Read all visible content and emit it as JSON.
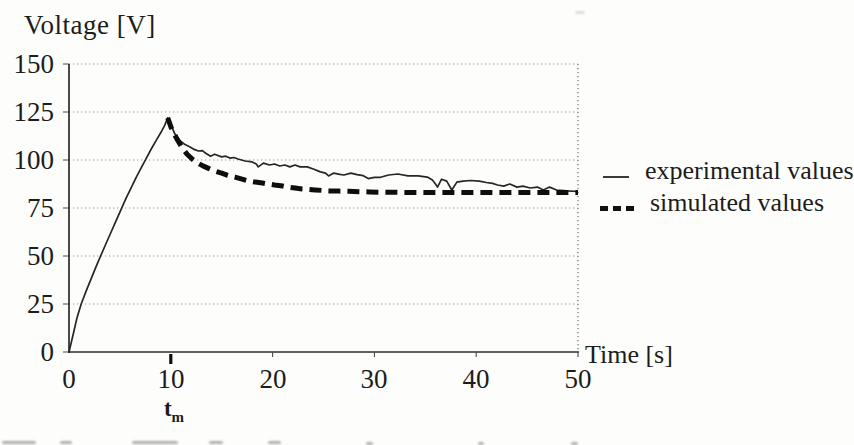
{
  "title": "Voltage [V]",
  "x_axis": {
    "label": "Time [s]",
    "ticks": [
      "0",
      "10",
      "20",
      "30",
      "40",
      "50"
    ],
    "marker_label": "t",
    "marker_sub": "m"
  },
  "y_axis": {
    "ticks": [
      "150",
      "125",
      "100",
      "75",
      "50",
      "25",
      "0"
    ]
  },
  "legend": {
    "items": [
      {
        "label": "experimental values",
        "style": "solid"
      },
      {
        "label": "simulated values",
        "style": "dashed"
      }
    ]
  },
  "colors": {
    "ink": "#1c1c1c",
    "grid": "#9b9b9b",
    "axis": "#2b2b2b",
    "background": "#fdfdfb"
  },
  "chart_data": {
    "type": "line",
    "title": "Voltage [V]",
    "xlabel": "Time [s]",
    "ylabel": "Voltage [V]",
    "xlim": [
      0,
      50
    ],
    "ylim": [
      0,
      150
    ],
    "x_ticks": [
      0,
      10,
      20,
      30,
      40,
      50
    ],
    "y_ticks": [
      0,
      25,
      50,
      75,
      100,
      125,
      150
    ],
    "grid": true,
    "grid_style": "dotted",
    "legend_position": "right",
    "annotations": [
      {
        "text": "tm",
        "x": 10,
        "meaning": "bold tick below x-axis marking time of voltage maximum"
      }
    ],
    "series": [
      {
        "name": "experimental values",
        "line": "solid",
        "width": "thin",
        "points": [
          [
            0,
            0
          ],
          [
            0.4,
            9
          ],
          [
            0.8,
            18
          ],
          [
            1.2,
            25
          ],
          [
            1.7,
            32
          ],
          [
            2.2,
            38.5
          ],
          [
            2.7,
            45
          ],
          [
            3.1,
            50
          ],
          [
            3.6,
            56
          ],
          [
            4.1,
            62
          ],
          [
            4.6,
            68
          ],
          [
            5.1,
            74
          ],
          [
            5.6,
            80
          ],
          [
            6.1,
            85.5
          ],
          [
            6.6,
            91
          ],
          [
            7.1,
            96
          ],
          [
            7.6,
            101
          ],
          [
            8.1,
            106
          ],
          [
            8.6,
            110.5
          ],
          [
            9.1,
            115
          ],
          [
            9.4,
            118
          ],
          [
            9.7,
            122
          ],
          [
            10.0,
            118.5
          ],
          [
            10.4,
            113.5
          ],
          [
            10.9,
            110
          ],
          [
            11.4,
            108
          ],
          [
            11.9,
            106.8
          ],
          [
            12.3,
            105.5
          ],
          [
            12.7,
            104.7
          ],
          [
            13.1,
            104.9
          ],
          [
            13.4,
            103.6
          ],
          [
            13.9,
            102
          ],
          [
            14.3,
            103
          ],
          [
            15.0,
            101.6
          ],
          [
            15.4,
            102
          ],
          [
            15.8,
            101
          ],
          [
            16.2,
            101.3
          ],
          [
            16.6,
            100.5
          ],
          [
            17.3,
            99.5
          ],
          [
            18.0,
            99
          ],
          [
            18.4,
            97.9
          ],
          [
            18.6,
            96.4
          ],
          [
            19.1,
            98.4
          ],
          [
            19.7,
            97.4
          ],
          [
            20.2,
            97.9
          ],
          [
            20.7,
            96.9
          ],
          [
            21.2,
            97.4
          ],
          [
            21.7,
            96.4
          ],
          [
            22.2,
            97.4
          ],
          [
            22.7,
            96.4
          ],
          [
            23.4,
            96.4
          ],
          [
            24.0,
            95.3
          ],
          [
            24.7,
            93.8
          ],
          [
            25.2,
            93.2
          ],
          [
            25.5,
            91.7
          ],
          [
            26.0,
            93.2
          ],
          [
            26.6,
            92.5
          ],
          [
            27.0,
            92.2
          ],
          [
            27.7,
            93.2
          ],
          [
            28.3,
            92.4
          ],
          [
            28.9,
            91.8
          ],
          [
            29.4,
            90.3
          ],
          [
            30.0,
            91
          ],
          [
            30.6,
            91
          ],
          [
            31.4,
            92.2
          ],
          [
            32.3,
            92.7
          ],
          [
            33.3,
            91.7
          ],
          [
            34.3,
            91.7
          ],
          [
            35.2,
            91.1
          ],
          [
            35.7,
            89.6
          ],
          [
            36.0,
            87.5
          ],
          [
            36.2,
            85.9
          ],
          [
            36.6,
            90
          ],
          [
            37.1,
            89
          ],
          [
            37.6,
            84.4
          ],
          [
            38.1,
            88.5
          ],
          [
            38.7,
            89
          ],
          [
            39.5,
            89.3
          ],
          [
            40.3,
            89
          ],
          [
            41.0,
            88.3
          ],
          [
            41.6,
            87.8
          ],
          [
            42.1,
            87
          ],
          [
            42.7,
            86.4
          ],
          [
            43.3,
            87.5
          ],
          [
            44.0,
            85.9
          ],
          [
            44.6,
            86.4
          ],
          [
            45.3,
            85.4
          ],
          [
            46.0,
            85.9
          ],
          [
            46.6,
            84.4
          ],
          [
            47.2,
            85.9
          ],
          [
            47.9,
            84.4
          ],
          [
            48.9,
            83.9
          ],
          [
            50,
            83.6
          ]
        ]
      },
      {
        "name": "simulated values",
        "line": "dashed",
        "width": "bold",
        "points": [
          [
            9.7,
            122
          ],
          [
            10.1,
            116
          ],
          [
            10.6,
            111
          ],
          [
            11.1,
            106.5
          ],
          [
            11.6,
            103
          ],
          [
            12.1,
            100.5
          ],
          [
            12.6,
            98.5
          ],
          [
            13.2,
            96.8
          ],
          [
            13.7,
            95.6
          ],
          [
            14.3,
            94.2
          ],
          [
            15.0,
            93.2
          ],
          [
            15.6,
            92
          ],
          [
            16.3,
            91.1
          ],
          [
            17.0,
            90
          ],
          [
            17.6,
            89.1
          ],
          [
            18.3,
            88.5
          ],
          [
            19.0,
            88
          ],
          [
            19.6,
            87.5
          ],
          [
            20.2,
            87
          ],
          [
            21.0,
            86.4
          ],
          [
            21.5,
            85.9
          ],
          [
            22.2,
            85.4
          ],
          [
            22.9,
            84.9
          ],
          [
            23.6,
            84.6
          ],
          [
            24.2,
            84.4
          ],
          [
            25.0,
            84.1
          ],
          [
            25.6,
            83.9
          ],
          [
            26.5,
            83.8
          ],
          [
            27.5,
            83.7
          ],
          [
            28.5,
            83.5
          ],
          [
            29.5,
            83.4
          ],
          [
            31,
            83.2
          ],
          [
            33,
            83.1
          ],
          [
            35,
            83
          ],
          [
            37,
            83
          ],
          [
            39,
            83
          ],
          [
            41,
            83
          ],
          [
            43,
            83
          ],
          [
            45,
            83
          ],
          [
            47,
            83
          ],
          [
            49,
            83
          ],
          [
            50,
            83
          ]
        ]
      }
    ]
  }
}
